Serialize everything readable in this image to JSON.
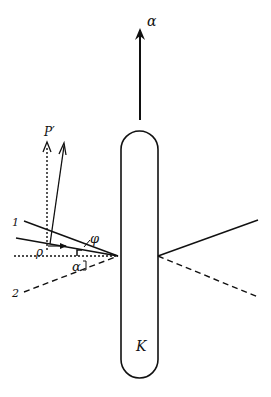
{
  "diagram": {
    "labels": {
      "velocity": "α",
      "momentum_prime": "P′",
      "ray_1": "1",
      "ray_2": "2",
      "angle_phi": "φ",
      "angle_alpha": "α",
      "angle_rho": "ρ",
      "body": "K"
    },
    "colors": {
      "ink": "#111111",
      "background": "#ffffff"
    }
  }
}
